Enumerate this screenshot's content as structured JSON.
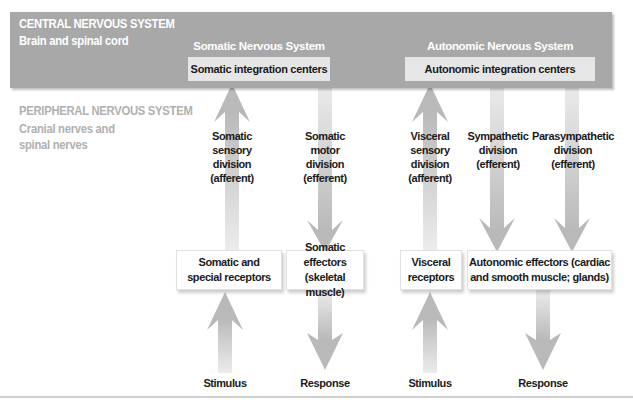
{
  "cns": {
    "title": "CENTRAL NERVOUS SYSTEM",
    "subtitle": "Brain and spinal cord",
    "band_color": "#a8a8a8"
  },
  "systems": {
    "somatic": {
      "label": "Somatic Nervous System",
      "integration": "Somatic integration centers"
    },
    "autonomic": {
      "label": "Autonomic Nervous System",
      "integration": "Autonomic integration centers"
    }
  },
  "pns": {
    "title": "PERIPHERAL NERVOUS SYSTEM",
    "subtitle_line1": "Cranial nerves and",
    "subtitle_line2": "spinal nerves",
    "text_color": "#b0b0b0"
  },
  "divisions": [
    {
      "lines": [
        "Somatic",
        "sensory",
        "division",
        "(afferent)"
      ],
      "direction": "up"
    },
    {
      "lines": [
        "Somatic",
        "motor",
        "division",
        "(efferent)"
      ],
      "direction": "down"
    },
    {
      "lines": [
        "Visceral",
        "sensory",
        "division",
        "(afferent)"
      ],
      "direction": "up"
    },
    {
      "lines": [
        "Sympathetic",
        "division",
        "(efferent)"
      ],
      "direction": "down"
    },
    {
      "lines": [
        "Parasympathetic",
        "division",
        "(efferent)"
      ],
      "direction": "down"
    }
  ],
  "lower_boxes": [
    {
      "line1": "Somatic and",
      "line2": "special receptors"
    },
    {
      "line1": "Somatic effectors",
      "line2": "(skeletal muscle)"
    },
    {
      "line1": "Visceral",
      "line2": "receptors"
    },
    {
      "line1": "Autonomic effectors (cardiac",
      "line2": "and smooth muscle; glands)"
    }
  ],
  "bottom_labels": [
    "Stimulus",
    "Response",
    "Stimulus",
    "Response"
  ],
  "colors": {
    "arrow": "#bdbdbd",
    "arrow_light": "#e4e4e4",
    "text_dark": "#1a1a1a"
  }
}
